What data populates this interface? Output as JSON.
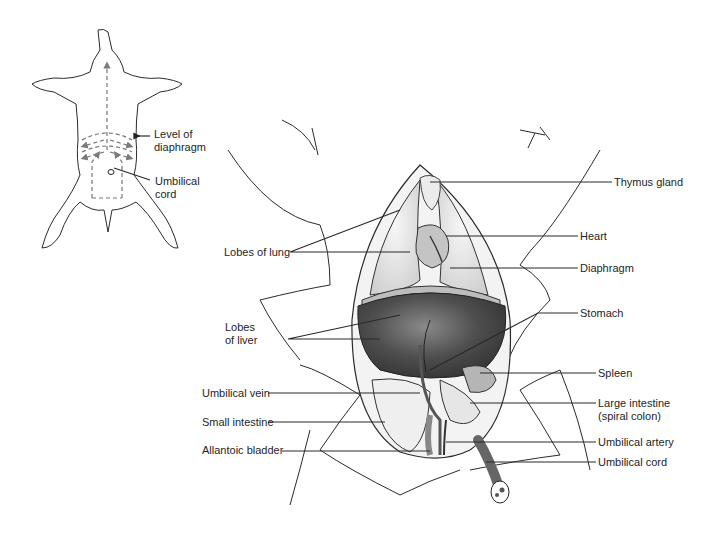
{
  "figure": {
    "inset": {
      "labels": [
        {
          "id": "level-of-diaphragm",
          "text": "Level of diaphragm",
          "lines": [
            "Level of",
            "diaphragm"
          ]
        },
        {
          "id": "umbilical-cord-inset",
          "text": "Umbilical cord",
          "lines": [
            "Umbilical",
            "cord"
          ]
        }
      ]
    },
    "left_labels": [
      {
        "id": "lobes-of-lung",
        "text": "Lobes of lung"
      },
      {
        "id": "lobes-of-liver",
        "text": "Lobes of liver",
        "lines": [
          "Lobes",
          "of liver"
        ]
      },
      {
        "id": "umbilical-vein",
        "text": "Umbilical vein"
      },
      {
        "id": "small-intestine",
        "text": "Small intestine"
      },
      {
        "id": "allantoic-bladder",
        "text": "Allantoic bladder"
      }
    ],
    "right_labels": [
      {
        "id": "thymus-gland",
        "text": "Thymus gland"
      },
      {
        "id": "heart",
        "text": "Heart"
      },
      {
        "id": "diaphragm",
        "text": "Diaphragm"
      },
      {
        "id": "stomach",
        "text": "Stomach"
      },
      {
        "id": "spleen",
        "text": "Spleen"
      },
      {
        "id": "large-intestine",
        "text": "Large intestine (spiral colon)",
        "lines": [
          "Large intestine",
          "(spiral colon)"
        ]
      },
      {
        "id": "umbilical-artery",
        "text": "Umbilical artery"
      },
      {
        "id": "umbilical-cord",
        "text": "Umbilical cord"
      }
    ],
    "colors": {
      "line": "#2b2b2b",
      "lung": "#e4e4e4",
      "liver": "#4a4a4a",
      "intestine": "#efefef",
      "heart": "#bdbdbd",
      "vessel": "#6a6a6a",
      "dashed_arrows": "#7a7a7a"
    }
  }
}
